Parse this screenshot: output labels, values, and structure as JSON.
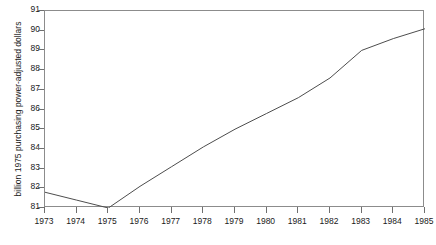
{
  "chart_data": {
    "type": "line",
    "title": "",
    "subtitle": "",
    "xlabel": "",
    "ylabel": "billion 1975 purchasing power-adjusted dollars",
    "x": [
      1973,
      1974,
      1975,
      1976,
      1977,
      1978,
      1979,
      1980,
      1981,
      1982,
      1983,
      1984,
      1985
    ],
    "xtick_labels": [
      "1973",
      "1974",
      "1975",
      "1976",
      "1977",
      "1978",
      "1979",
      "1980",
      "1981",
      "1982",
      "1983",
      "1984",
      "1985"
    ],
    "ytick_labels": [
      "81",
      "82",
      "83",
      "84",
      "85",
      "86",
      "87",
      "88",
      "89",
      "90",
      "91"
    ],
    "yticks": [
      81,
      82,
      83,
      84,
      85,
      86,
      87,
      88,
      89,
      90,
      91
    ],
    "values": [
      81.8,
      81.4,
      81.0,
      82.1,
      83.1,
      84.1,
      85.0,
      85.8,
      86.6,
      87.6,
      89.0,
      89.6,
      90.1
    ],
    "series": [
      {
        "name": "",
        "values": [
          81.8,
          81.4,
          81.0,
          82.1,
          83.1,
          84.1,
          85.0,
          85.8,
          86.6,
          87.6,
          89.0,
          89.6,
          90.1
        ],
        "color": "#4d4d4d"
      }
    ],
    "xlim": [
      1973,
      1985
    ],
    "ylim": [
      81,
      91
    ],
    "grid": false,
    "legend": false,
    "legend_position": "none",
    "frame_color": "#8c8c8c",
    "line_color": "#4d4d4d",
    "background": "#ffffff",
    "annotations": []
  }
}
